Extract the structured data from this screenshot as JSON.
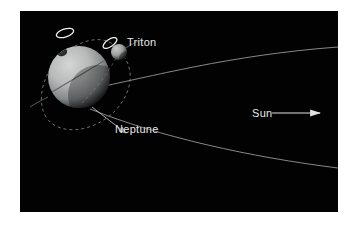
{
  "figure": {
    "kind": "astronomy-diagram",
    "background_color": "#020202",
    "page_color": "#ffffff",
    "label_color": "#e8e8e8",
    "panel": {
      "x": 20,
      "y": 11,
      "width": 318,
      "height": 201
    }
  },
  "labels": {
    "triton": "Triton",
    "neptune": "Neptune",
    "sun": "Sun"
  },
  "bodies": {
    "neptune": {
      "name": "Neptune",
      "center_x": 59,
      "center_y": 66,
      "radius": 31,
      "body_color": "#b9bcba",
      "shadow_color": "#0d0f10",
      "dark_spot": {
        "x": 42,
        "y": 41,
        "rx": 5,
        "ry": 4,
        "color": "#2a2c2f"
      },
      "pole_marker_color": "#f2f2f2"
    },
    "triton": {
      "name": "Triton",
      "center_x": 99,
      "center_y": 41,
      "radius": 8,
      "body_color": "#a8aaa9",
      "shadow_color": "#141617",
      "crescent_color": "#f0f0f0"
    }
  },
  "orbits": {
    "triton_orbit": {
      "label": "Triton orbit around Neptune",
      "style": "dashed",
      "color": "#8f9296",
      "dash": "3 3"
    },
    "neptune_orbit": {
      "label": "Neptune orbit path toward the Sun",
      "style": "solid",
      "color": "#9fa2a4",
      "arrow": true
    },
    "equator_ring": {
      "label": "Neptune equatorial ring plane",
      "style": "solid",
      "color": "#6d7073"
    }
  },
  "sun_arrow": {
    "label": "Sun direction arrow",
    "color": "#e2e2e2",
    "direction": "right",
    "x1": 252,
    "y1": 102,
    "x2": 300,
    "y2": 102
  }
}
